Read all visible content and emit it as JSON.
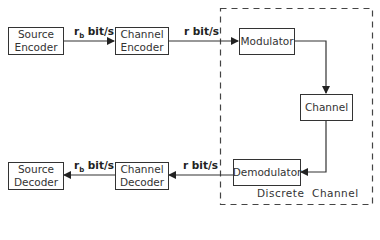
{
  "diagram": {
    "type": "block-diagram",
    "blocks": [
      {
        "id": "source-encoder",
        "label": "Source\nEncoder",
        "line1": "Source",
        "line2": "Encoder"
      },
      {
        "id": "channel-encoder",
        "label": "Channel\nEncoder",
        "line1": "Channel",
        "line2": "Encoder"
      },
      {
        "id": "modulator",
        "label": "Modulator"
      },
      {
        "id": "channel",
        "label": "Channel"
      },
      {
        "id": "demodulator",
        "label": "Demodulator"
      },
      {
        "id": "channel-decoder",
        "label": "Channel\nDecoder",
        "line1": "Channel",
        "line2": "Decoder"
      },
      {
        "id": "source-decoder",
        "label": "Source\nDecoder",
        "line1": "Source",
        "line2": "Decoder"
      }
    ],
    "edges": [
      {
        "from": "source-encoder",
        "to": "channel-encoder",
        "label": "r_b bit/s"
      },
      {
        "from": "channel-encoder",
        "to": "modulator",
        "label": "r bit/s"
      },
      {
        "from": "modulator",
        "to": "channel",
        "label": ""
      },
      {
        "from": "channel",
        "to": "demodulator",
        "label": ""
      },
      {
        "from": "demodulator",
        "to": "channel-decoder",
        "label": "r bit/s"
      },
      {
        "from": "channel-decoder",
        "to": "source-decoder",
        "label": "r_b bit/s"
      }
    ],
    "rate_labels": {
      "rb_main": "r",
      "rb_sub": "b",
      "bits_unit": " bit/s",
      "r_bits": "r bit/s"
    },
    "group": {
      "label": "Discrete  Channel",
      "style": "dashed",
      "contains": [
        "modulator",
        "channel",
        "demodulator"
      ]
    }
  }
}
